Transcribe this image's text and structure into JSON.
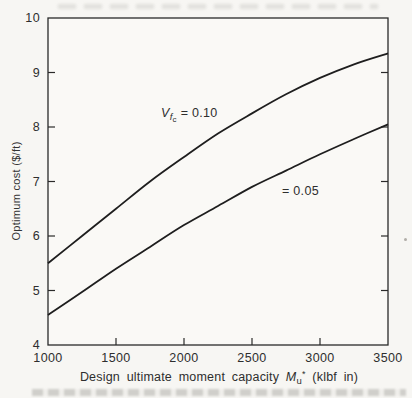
{
  "figure": {
    "y_axis_label": "Optimum cost ($/ft)",
    "x_axis_label_rich": [
      {
        "t": "Design ultimate moment capacity ",
        "cls": ""
      },
      {
        "t": "M",
        "cls": "i"
      },
      {
        "t": "u",
        "cls": "sub1"
      },
      {
        "t": "*",
        "cls": "sup1"
      },
      {
        "t": " (klbf in)",
        "cls": ""
      }
    ],
    "curve_label_upper_rich": [
      {
        "t": "V",
        "cls": "i"
      },
      {
        "t": "f",
        "cls": "i sub1"
      },
      {
        "t": "c",
        "cls": "sub2"
      },
      {
        "t": " = 0.10",
        "cls": ""
      }
    ],
    "curve_label_lower": "= 0.05"
  },
  "chart_data": {
    "type": "line",
    "title": "",
    "xlabel": "Design ultimate moment capacity Mu* (klbf in)",
    "ylabel": "Optimum cost ($/ft)",
    "xlim": [
      1000,
      3500
    ],
    "ylim": [
      4,
      10
    ],
    "x_ticks": [
      1000,
      1500,
      2000,
      2500,
      3000,
      3500
    ],
    "y_ticks": [
      4,
      5,
      6,
      7,
      8,
      9,
      10
    ],
    "grid": false,
    "legend_position": "inline-annotations",
    "x": [
      1000,
      1250,
      1500,
      1750,
      2000,
      2250,
      2500,
      2750,
      3000,
      3250,
      3500
    ],
    "series": [
      {
        "name": "Vfc = 0.10",
        "values": [
          5.5,
          6.0,
          6.5,
          7.0,
          7.45,
          7.88,
          8.25,
          8.6,
          8.9,
          9.15,
          9.35
        ]
      },
      {
        "name": "Vfc = 0.05",
        "values": [
          4.55,
          4.97,
          5.4,
          5.8,
          6.2,
          6.55,
          6.9,
          7.2,
          7.5,
          7.78,
          8.05
        ]
      }
    ],
    "line_color": "#1e1e1e",
    "frame_color": "#2a2a2a",
    "background": "#f7f6f3"
  }
}
